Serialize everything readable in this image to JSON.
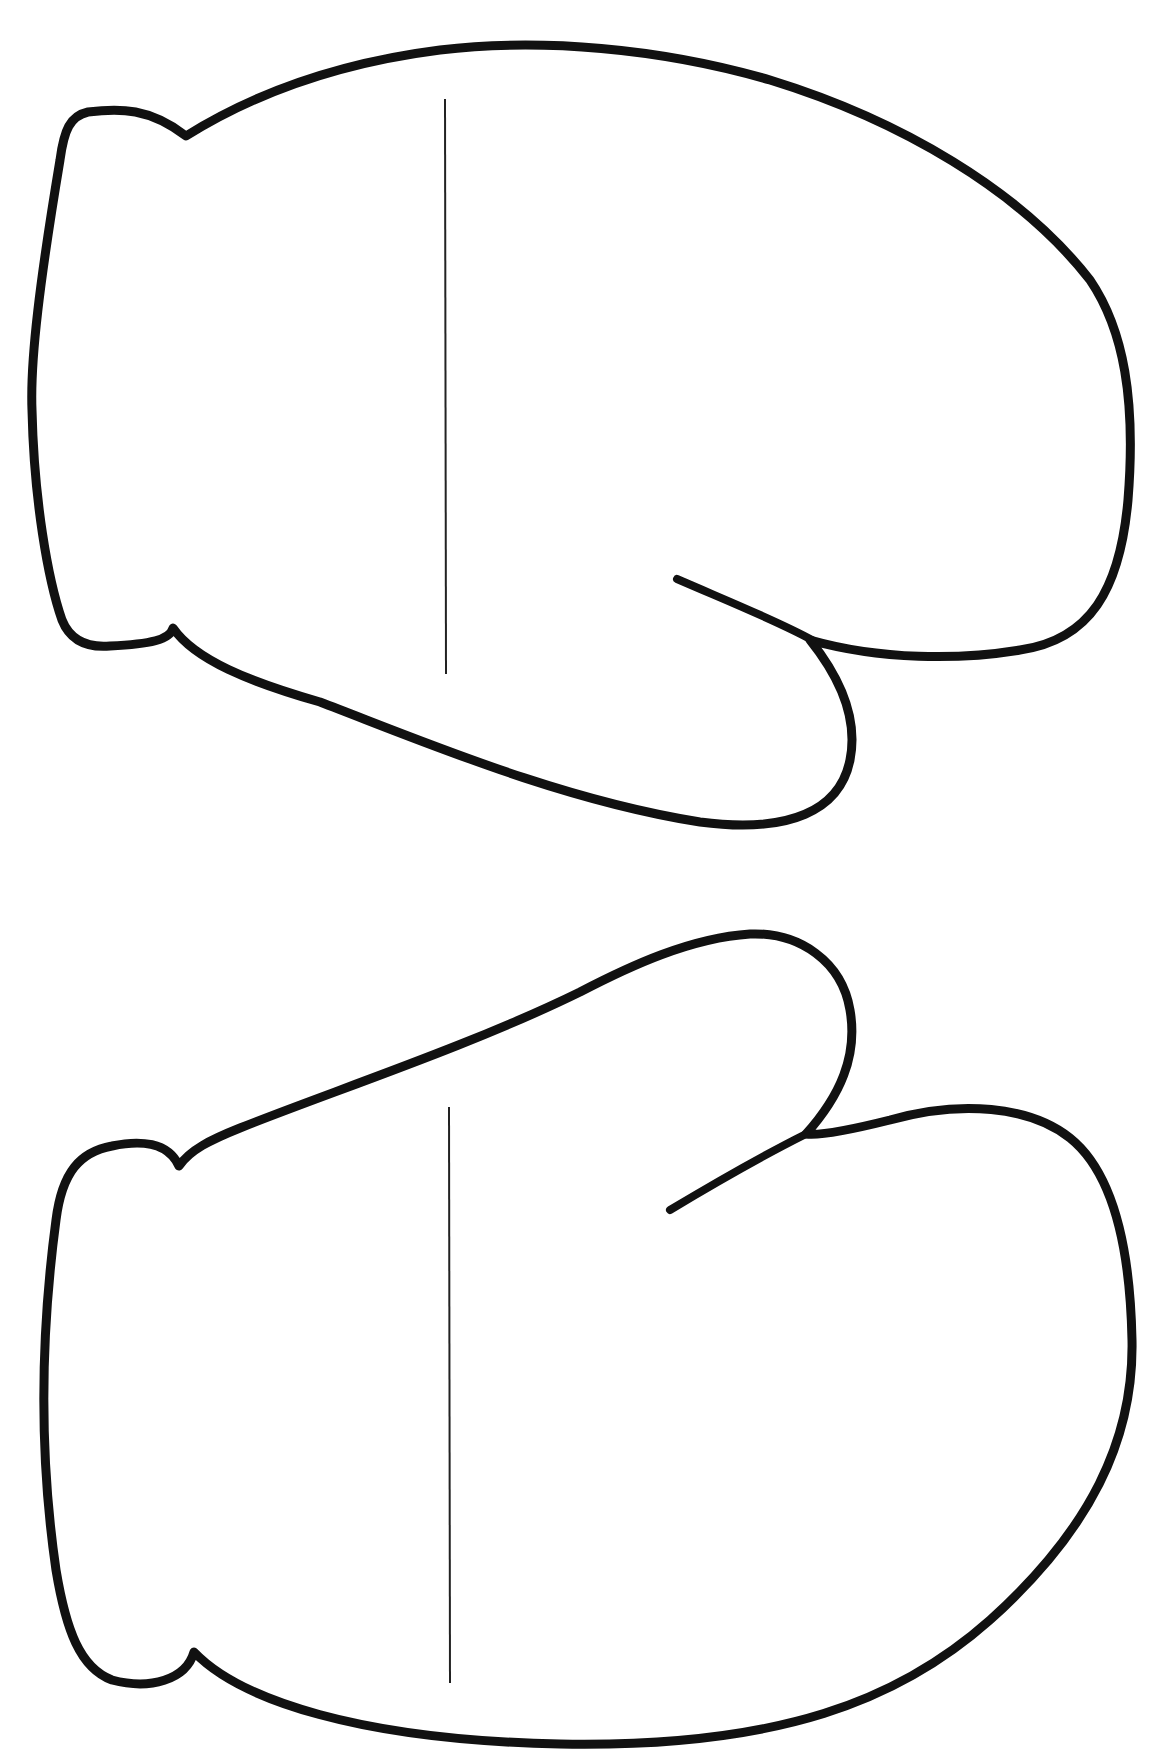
{
  "document": {
    "type": "printable-template",
    "subject": "mitten outlines",
    "background_color": "#ffffff",
    "outline_color": "#111111",
    "fold_line_color": "#222222"
  },
  "mittens": [
    {
      "id": "top",
      "orientation": "thumb-bottom-right",
      "fold_line": {
        "x": 445,
        "y1": 99,
        "y2": 674
      }
    },
    {
      "id": "bottom",
      "orientation": "thumb-top-right",
      "fold_line": {
        "x": 449,
        "y1": 1107,
        "y2": 1683
      }
    }
  ]
}
